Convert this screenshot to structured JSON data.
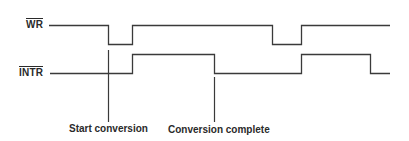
{
  "diagram": {
    "type": "timing-diagram",
    "colors": {
      "line": "#3a3a3a",
      "text": "#2a2a2a",
      "background": "#ffffff"
    },
    "signals": [
      {
        "id": "wr",
        "label": "WR",
        "active_low": true,
        "sequence": [
          "high",
          "low",
          "high",
          "low",
          "high"
        ]
      },
      {
        "id": "intr",
        "label": "INTR",
        "active_low": true,
        "sequence": [
          "low",
          "high",
          "low",
          "high",
          "low"
        ]
      }
    ],
    "annotations": [
      {
        "id": "start",
        "label": "Start conversion"
      },
      {
        "id": "complete",
        "label": "Conversion complete"
      }
    ]
  }
}
